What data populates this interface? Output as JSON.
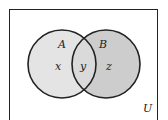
{
  "diagram": {
    "type": "venn",
    "universe_label": "U",
    "sets": [
      {
        "name": "A",
        "region_label": "x"
      },
      {
        "name": "B",
        "region_label": "z"
      }
    ],
    "intersection_label": "y",
    "colors": {
      "background": "#ffffff",
      "border": "#222222",
      "set_a_fill": "#e4e4e4",
      "set_b_fill": "#cdcdcd",
      "intersection_fill": "#dadada"
    }
  }
}
